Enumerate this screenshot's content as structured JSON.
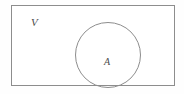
{
  "figure": {
    "kind": "venn-diagram",
    "universe": {
      "label": "V",
      "shape": "rectangle",
      "stroke_color": "#8d8d8d",
      "fill_color": "#ffffff"
    },
    "set_a": {
      "label": "A",
      "shape": "circle",
      "stroke_color": "#8d8d8d",
      "fill_color": "none"
    },
    "background_color": "#fefefe",
    "label_color": "#4a4a4a"
  }
}
